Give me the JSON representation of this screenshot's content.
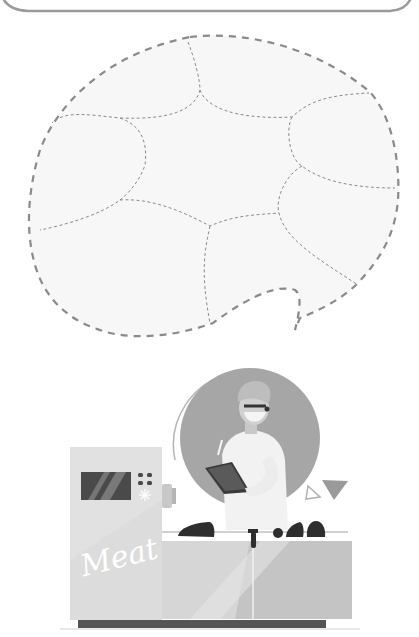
{
  "header_box": {
    "visible_portion": "bottom edge of rounded rectangle",
    "stroke_color": "#9a9a9a"
  },
  "speech_bubble": {
    "style": "dashed outline, light fill, divided by thin dashed curves into puzzle-like regions",
    "outline_color": "#8a8a8a",
    "fill_color": "#f7f7f7",
    "region_count": 8
  },
  "illustration": {
    "subject": "food technician inspecting meat processing machine",
    "machine_label": "Meat",
    "colors": {
      "circle_bg": "#a6a6a6",
      "machine_body": "#dcdcdc",
      "machine_shadow": "#c4c4c4",
      "screen": "#4a4a4a",
      "base": "#555555",
      "meat_pieces": "#2e2e2e",
      "coat": "#f2f2f2",
      "triangle": "#9a9a9a"
    },
    "meat_pieces_count": 4
  }
}
